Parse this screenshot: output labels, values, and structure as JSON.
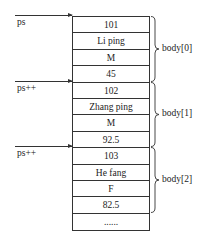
{
  "pointers": [
    {
      "label": "ps"
    },
    {
      "label": "ps++"
    },
    {
      "label": "ps++"
    }
  ],
  "cells": [
    "101",
    "Li ping",
    "M",
    "45",
    "102",
    "Zhang ping",
    "M",
    "92.5",
    "103",
    "He fang",
    "F",
    "82.5",
    "......"
  ],
  "groups": [
    {
      "label": "body[0]"
    },
    {
      "label": "body[1]"
    },
    {
      "label": "body[2]"
    }
  ]
}
